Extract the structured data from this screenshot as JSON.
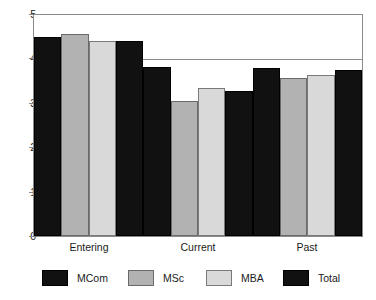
{
  "chart_data": {
    "type": "bar",
    "title": "",
    "subtitle": "",
    "xlabel": "",
    "ylabel": "",
    "categories": [
      "Entering",
      "Current",
      "Past"
    ],
    "series": [
      {
        "name": "MCom",
        "color": "#111111",
        "values": [
          4.5,
          3.82,
          3.8
        ]
      },
      {
        "name": "MSc",
        "color": "#b2b2b2",
        "values": [
          4.57,
          3.05,
          3.58
        ]
      },
      {
        "name": "MBA",
        "color": "#d9d9d9",
        "values": [
          4.42,
          3.35,
          3.65
        ]
      },
      {
        "name": "Total",
        "color": "#111111",
        "values": [
          4.42,
          3.28,
          3.75
        ]
      }
    ],
    "ylim": [
      0,
      5
    ],
    "yticks": [
      0,
      1,
      2,
      3,
      4,
      5
    ],
    "ytick_labels": [
      "0",
      "1",
      "2",
      "3",
      "4",
      "5"
    ],
    "grid": true,
    "grid_axis": "y",
    "legend_position": "bottom",
    "bar_gap": "none",
    "plot_border": true
  },
  "legend": {
    "items": [
      {
        "label": "MCom"
      },
      {
        "label": "MSc"
      },
      {
        "label": "MBA"
      },
      {
        "label": "Total"
      }
    ]
  }
}
